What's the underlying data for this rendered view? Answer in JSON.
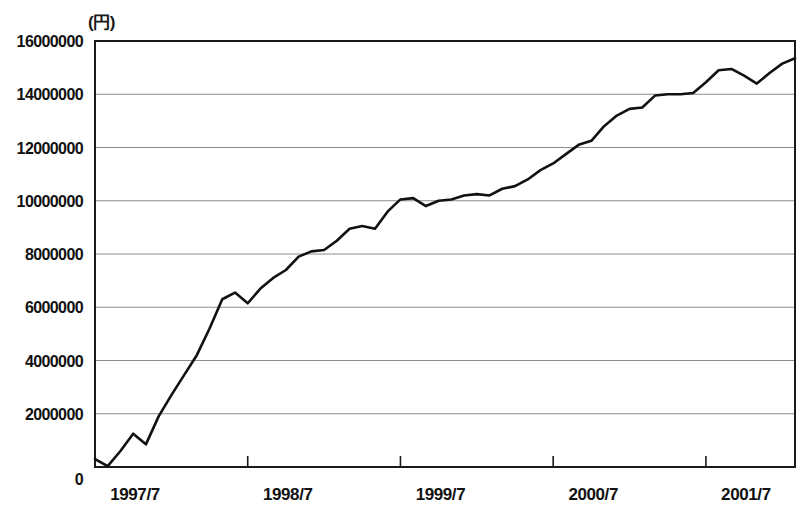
{
  "chart_data": {
    "type": "line",
    "title": "",
    "subtitle": "",
    "unit_label": "(円)",
    "xlabel": "",
    "ylabel": "",
    "ylim": [
      0,
      16000000
    ],
    "xlim": [
      "1997/7",
      "2002/2"
    ],
    "grid": true,
    "legend": "none",
    "y_ticks": [
      0,
      2000000,
      4000000,
      6000000,
      8000000,
      10000000,
      12000000,
      14000000,
      16000000
    ],
    "y_tick_labels": [
      "0",
      "2000000",
      "4000000",
      "6000000",
      "8000000",
      "10000000",
      "12000000",
      "14000000",
      "16000000"
    ],
    "x_ticks": [
      "1997/7",
      "1998/7",
      "1999/7",
      "2000/7",
      "2001/7"
    ],
    "x_tick_labels": [
      "1997/7",
      "1998/7",
      "1999/7",
      "2000/7",
      "2001/7"
    ],
    "line_color": "#111111",
    "grid_color": "#8c8c8c",
    "axis_color": "#1a1a1a",
    "background_color": "#ffffff",
    "series": [
      {
        "name": "累計額",
        "x": [
          "1997/7",
          "1997/8",
          "1997/9",
          "1997/10",
          "1997/11",
          "1997/12",
          "1998/1",
          "1998/2",
          "1998/3",
          "1998/4",
          "1998/5",
          "1998/6",
          "1998/7",
          "1998/8",
          "1998/9",
          "1998/10",
          "1998/11",
          "1998/12",
          "1999/1",
          "1999/2",
          "1999/3",
          "1999/4",
          "1999/5",
          "1999/6",
          "1999/7",
          "1999/8",
          "1999/9",
          "1999/10",
          "1999/11",
          "1999/12",
          "2000/1",
          "2000/2",
          "2000/3",
          "2000/4",
          "2000/5",
          "2000/6",
          "2000/7",
          "2000/8",
          "2000/9",
          "2000/10",
          "2000/11",
          "2000/12",
          "2001/1",
          "2001/2",
          "2001/3",
          "2001/4",
          "2001/5",
          "2001/6",
          "2001/7",
          "2001/8",
          "2001/9",
          "2001/10",
          "2001/11",
          "2001/12",
          "2002/1",
          "2002/2"
        ],
        "values": [
          300000,
          30000,
          600000,
          1250000,
          850000,
          1900000,
          2700000,
          3450000,
          4200000,
          5200000,
          6300000,
          6550000,
          6150000,
          6700000,
          7100000,
          7400000,
          7900000,
          8100000,
          8150000,
          8500000,
          8950000,
          9050000,
          8950000,
          9600000,
          10050000,
          10100000,
          9800000,
          10000000,
          10050000,
          10200000,
          10250000,
          10200000,
          10450000,
          10550000,
          10800000,
          11150000,
          11400000,
          11750000,
          12100000,
          12250000,
          12800000,
          13200000,
          13450000,
          13500000,
          13950000,
          14000000,
          14000000,
          14050000,
          14450000,
          14900000,
          14950000,
          14700000,
          14400000,
          14800000,
          15150000,
          15350000
        ]
      }
    ]
  }
}
